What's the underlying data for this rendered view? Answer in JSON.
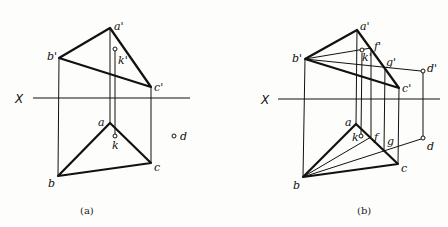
{
  "figures": [
    {
      "id": "a",
      "caption": "(a)",
      "axis_label": "X",
      "points": {
        "a_prime": {
          "label": "a'",
          "x": 110,
          "y": 28
        },
        "b_prime": {
          "label": "b'",
          "x": 59,
          "y": 58
        },
        "c_prime": {
          "label": "c'",
          "x": 151,
          "y": 87
        },
        "k_prime": {
          "label": "k'",
          "x": 115,
          "y": 49
        },
        "a": {
          "label": "a",
          "x": 110,
          "y": 123
        },
        "b": {
          "label": "b",
          "x": 58,
          "y": 176
        },
        "c": {
          "label": "c",
          "x": 151,
          "y": 163
        },
        "k": {
          "label": "k",
          "x": 115,
          "y": 136
        },
        "d": {
          "label": "d",
          "x": 174,
          "y": 136
        }
      }
    },
    {
      "id": "b",
      "caption": "(b)",
      "axis_label": "X",
      "points": {
        "a_prime": {
          "label": "a'",
          "x": 357,
          "y": 30
        },
        "b_prime": {
          "label": "b'",
          "x": 305,
          "y": 59
        },
        "c_prime": {
          "label": "c'",
          "x": 399,
          "y": 88
        },
        "k_prime": {
          "label": "k'",
          "x": 362,
          "y": 51
        },
        "f_prime": {
          "label": "f'",
          "x": 371,
          "y": 48
        },
        "g_prime": {
          "label": "g'",
          "x": 385,
          "y": 68
        },
        "d_prime": {
          "label": "d'",
          "x": 423,
          "y": 71
        },
        "a": {
          "label": "a",
          "x": 356,
          "y": 124
        },
        "b": {
          "label": "b",
          "x": 303,
          "y": 177
        },
        "c": {
          "label": "c",
          "x": 398,
          "y": 164
        },
        "k": {
          "label": "k",
          "x": 361,
          "y": 136
        },
        "f": {
          "label": "f",
          "x": 371,
          "y": 137
        },
        "g": {
          "label": "g",
          "x": 384,
          "y": 150
        },
        "d": {
          "label": "d",
          "x": 423,
          "y": 138
        }
      }
    }
  ]
}
